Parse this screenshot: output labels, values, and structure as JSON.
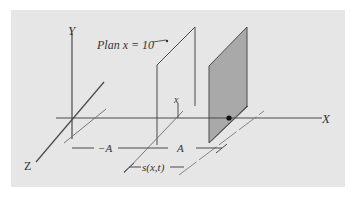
{
  "figure": {
    "type": "3D coordinate sketch with two planes",
    "colors": {
      "panel_background": "#e6e6e6",
      "line": "#4a4a4a",
      "shaded_plane": "#a9a9a9",
      "dot": "#111111"
    }
  },
  "axes": {
    "x_label": "X",
    "y_label": "Y",
    "z_label": "Z"
  },
  "annotations": {
    "plane_label": "Plan x = 10",
    "point_label": "x",
    "neg_a_label": "−A",
    "pos_a_label": "A",
    "s_label": "s(x,t)"
  }
}
